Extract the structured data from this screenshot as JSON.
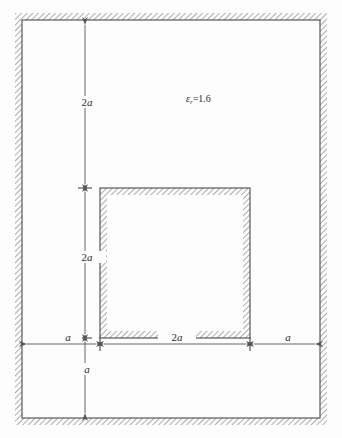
{
  "figure": {
    "type": "cross-section-diagram",
    "colors": {
      "background": "#fdfdfd",
      "conductor_line": "#4a4a4a",
      "hatch": "#9a9a9a",
      "dimension_line": "#555555",
      "text": "#2a2a2a"
    },
    "material": {
      "permittivity_symbol": "ε",
      "permittivity_subscript": "r",
      "equals": "=",
      "permittivity_value": "1.6",
      "full_label": "ε_r = 1.6"
    },
    "dimensions": {
      "outer_top_gap": "2a",
      "inner_square_height": "2a",
      "outer_bottom_gap": "a",
      "left_gap": "a",
      "inner_square_width": "2a",
      "right_gap": "a"
    },
    "geometry": {
      "outer_square": {
        "x": 22,
        "y": 20,
        "width": 298,
        "height": 398
      },
      "inner_square": {
        "x": 100,
        "y": 188,
        "width": 150,
        "height": 150
      },
      "hatch_thickness": 7,
      "vertical_dim_x": 85,
      "horizontal_dim_y": 344
    }
  }
}
